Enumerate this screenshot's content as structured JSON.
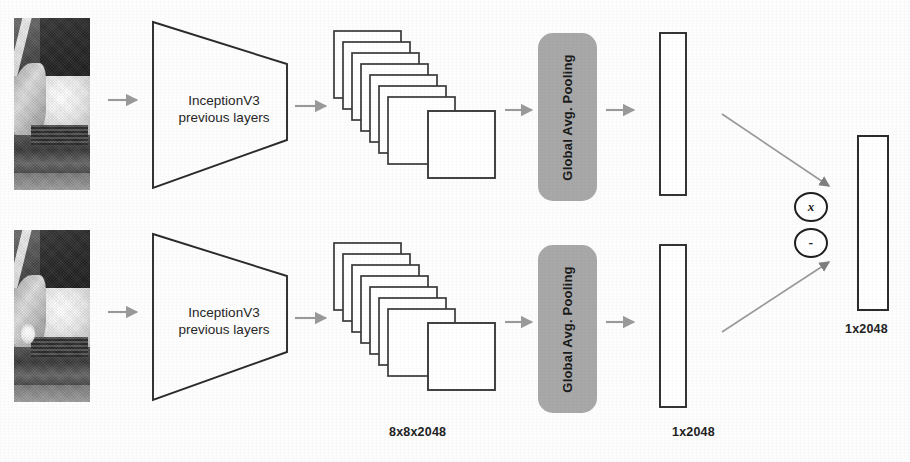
{
  "figure": {
    "background_color": "#fdfdfd",
    "stroke_color": "#2b2b2b",
    "arrow_color": "#9a9a9a",
    "pooling_fill_color": "#a8a8a8",
    "text_color": "#1e1e1e"
  },
  "branches": [
    {
      "id": "top",
      "input_image": {
        "name": "car-front-photo-top",
        "alt": "grayscale photo of a car front fender and hood"
      },
      "backbone_label_line1": "InceptionV3",
      "backbone_label_line2": "previous layers",
      "feature_maps": {
        "count": 8,
        "label": "8x8x2048"
      },
      "pooling_label": "Global Avg. Pooling",
      "embedding_label": "1x2048"
    },
    {
      "id": "bottom",
      "input_image": {
        "name": "car-front-photo-bottom",
        "alt": "grayscale photo of a car front with visible headlight"
      },
      "backbone_label_line1": "InceptionV3",
      "backbone_label_line2": "previous layers",
      "feature_maps": {
        "count": 8,
        "label": "8x8x2048"
      },
      "pooling_label": "Global Avg. Pooling",
      "embedding_label": "1x2048"
    }
  ],
  "merge": {
    "operators": [
      {
        "name": "multiply-operator",
        "symbol": "x"
      },
      {
        "name": "subtract-operator",
        "symbol": "-"
      }
    ],
    "output_label": "1x2048"
  },
  "shared_labels": {
    "feature_map_dims": "8x8x2048",
    "embedding_dims": "1x2048",
    "output_dims": "1x2048"
  }
}
